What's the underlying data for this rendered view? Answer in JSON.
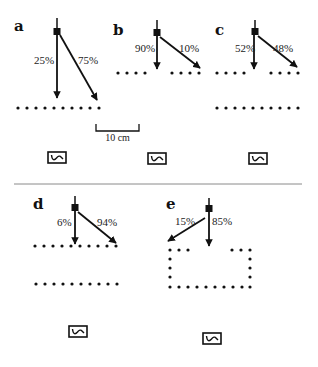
{
  "figure": {
    "scale_bar": {
      "label": "10 cm"
    },
    "panels": [
      {
        "id": "a",
        "label": "a",
        "left_pct": "25%",
        "right_pct": "75%"
      },
      {
        "id": "b",
        "label": "b",
        "left_pct": "90%",
        "right_pct": "10%"
      },
      {
        "id": "c",
        "label": "c",
        "left_pct": "52%",
        "right_pct": "48%"
      },
      {
        "id": "d",
        "label": "d",
        "left_pct": "6%",
        "right_pct": "94%"
      },
      {
        "id": "e",
        "label": "e",
        "left_pct": "15%",
        "right_pct": "85%"
      }
    ],
    "icons": {
      "sensor": "sensor-box-icon",
      "source": "square-source-icon",
      "arrow": "arrow-icon"
    },
    "colors": {
      "ink": "#111111",
      "divider": "#8a8a8a",
      "background": "#ffffff"
    }
  }
}
